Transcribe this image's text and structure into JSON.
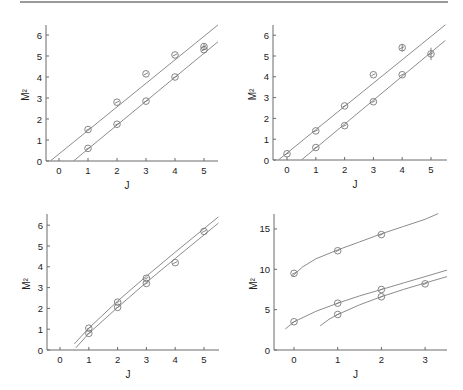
{
  "figure": {
    "top_rule": true
  },
  "chart_data": [
    {
      "id": "panel-top-left",
      "type": "scatter",
      "title": "",
      "xlabel": "J",
      "ylabel": "M²",
      "xlim": [
        -0.5,
        5.5
      ],
      "ylim": [
        0,
        6.5
      ],
      "xticks": [
        0,
        1,
        2,
        3,
        4,
        5
      ],
      "yticks": [
        0,
        1,
        2,
        3,
        4,
        5,
        6
      ],
      "grid": false,
      "box": {
        "x0": 46,
        "y0": 161,
        "x_of_j0": 59,
        "px_per_x": 29,
        "px_per_y": 21,
        "x_end": 218,
        "y_top": 25
      },
      "series": [
        {
          "name": "upper",
          "x": [
            1,
            2,
            3,
            4,
            5
          ],
          "y": [
            1.5,
            2.8,
            4.15,
            5.05,
            5.45
          ],
          "err": [
            0,
            0,
            0,
            0,
            0.15
          ]
        },
        {
          "name": "lower",
          "x": [
            1,
            2,
            3,
            4,
            5
          ],
          "y": [
            0.6,
            1.75,
            2.85,
            4.0,
            5.3
          ],
          "err": [
            0,
            0,
            0,
            0,
            0
          ]
        }
      ],
      "fits": [
        {
          "name": "upper-fit",
          "points": [
            [
              -0.3,
              0
            ],
            [
              5.5,
              6.5
            ]
          ]
        },
        {
          "name": "lower-fit",
          "points": [
            [
              0.5,
              0
            ],
            [
              5.5,
              5.7
            ]
          ]
        }
      ]
    },
    {
      "id": "panel-top-right",
      "type": "scatter",
      "title": "",
      "xlabel": "J",
      "ylabel": "M²",
      "xlim": [
        -0.5,
        5.5
      ],
      "ylim": [
        0,
        6.5
      ],
      "xticks": [
        0,
        1,
        2,
        3,
        4,
        5
      ],
      "yticks": [
        0,
        1,
        2,
        3,
        4,
        5,
        6
      ],
      "grid": false,
      "box": {
        "x0": 273,
        "y0": 160,
        "x_of_j0": 287,
        "px_per_x": 28.8,
        "px_per_y": 20.8,
        "x_end": 447,
        "y_top": 25
      },
      "series": [
        {
          "name": "upper",
          "x": [
            0,
            1,
            2,
            3,
            4
          ],
          "y": [
            0.3,
            1.4,
            2.6,
            4.1,
            5.4
          ],
          "err": [
            0,
            0,
            0,
            0,
            0.18
          ]
        },
        {
          "name": "lower",
          "x": [
            1,
            2,
            3,
            4,
            5
          ],
          "y": [
            0.6,
            1.65,
            2.8,
            4.1,
            5.1
          ],
          "err": [
            0,
            0,
            0,
            0,
            0.3
          ]
        }
      ],
      "fits": [
        {
          "name": "upper-fit",
          "points": [
            [
              -0.3,
              0
            ],
            [
              5.5,
              6.5
            ]
          ]
        },
        {
          "name": "lower-fit",
          "points": [
            [
              0.5,
              0
            ],
            [
              5.5,
              5.75
            ]
          ]
        }
      ]
    },
    {
      "id": "panel-bottom-left",
      "type": "scatter",
      "title": "",
      "xlabel": "J",
      "ylabel": "M²",
      "xlim": [
        -0.5,
        5.5
      ],
      "ylim": [
        0,
        6.5
      ],
      "xticks": [
        0,
        1,
        2,
        3,
        4,
        5
      ],
      "yticks": [
        0,
        1,
        2,
        3,
        4,
        5,
        6
      ],
      "grid": false,
      "box": {
        "x0": 47,
        "y0": 350,
        "x_of_j0": 60,
        "px_per_x": 28.8,
        "px_per_y": 20.8,
        "x_end": 219,
        "y_top": 214
      },
      "series": [
        {
          "name": "upper",
          "x": [
            1,
            2,
            3,
            5
          ],
          "y": [
            1.05,
            2.3,
            3.45,
            5.7
          ],
          "err": [
            0,
            0,
            0,
            0
          ]
        },
        {
          "name": "lower",
          "x": [
            1,
            2,
            3,
            4
          ],
          "y": [
            0.8,
            2.05,
            3.2,
            4.2
          ],
          "err": [
            0,
            0,
            0,
            0
          ]
        }
      ],
      "fits": [
        {
          "name": "upper-fit",
          "points": [
            [
              0.5,
              0.3
            ],
            [
              1,
              1.05
            ],
            [
              2,
              2.35
            ],
            [
              3,
              3.55
            ],
            [
              4,
              4.7
            ],
            [
              5.5,
              6.4
            ]
          ]
        },
        {
          "name": "lower-fit",
          "points": [
            [
              0.55,
              0.1
            ],
            [
              1,
              0.8
            ],
            [
              2,
              2.05
            ],
            [
              3,
              3.25
            ],
            [
              4,
              4.4
            ],
            [
              5.5,
              6.1
            ]
          ]
        }
      ]
    },
    {
      "id": "panel-bottom-right",
      "type": "scatter",
      "title": "",
      "xlabel": "J",
      "ylabel": "M²",
      "xlim": [
        -0.5,
        3.5
      ],
      "ylim": [
        0,
        17
      ],
      "xticks": [
        0,
        1,
        2,
        3
      ],
      "yticks": [
        0,
        5,
        10,
        15
      ],
      "grid": false,
      "box": {
        "x0": 274,
        "y0": 350,
        "x_of_j0": 294,
        "px_per_x": 43.7,
        "px_per_y": 8.07,
        "x_end": 447,
        "y_top": 214
      },
      "series": [
        {
          "name": "top",
          "x": [
            0,
            1,
            2
          ],
          "y": [
            9.5,
            12.3,
            14.3
          ],
          "err": [
            0,
            0,
            0
          ]
        },
        {
          "name": "middle",
          "x": [
            0,
            1,
            2
          ],
          "y": [
            3.5,
            5.8,
            7.5
          ],
          "err": [
            0,
            0,
            0
          ]
        },
        {
          "name": "lower",
          "x": [
            1,
            2,
            3
          ],
          "y": [
            4.4,
            6.6,
            8.2
          ],
          "err": [
            0,
            0,
            0
          ]
        }
      ],
      "fits": [
        {
          "name": "top-fit",
          "points": [
            [
              -0.05,
              9.1
            ],
            [
              0.2,
              10.3
            ],
            [
              0.5,
              11.3
            ],
            [
              1,
              12.4
            ],
            [
              1.5,
              13.4
            ],
            [
              2,
              14.4
            ],
            [
              2.5,
              15.3
            ],
            [
              3,
              16.2
            ],
            [
              3.3,
              16.9
            ]
          ]
        },
        {
          "name": "middle-fit",
          "points": [
            [
              -0.2,
              2.6
            ],
            [
              0,
              3.5
            ],
            [
              0.5,
              4.8
            ],
            [
              1,
              5.8
            ],
            [
              1.5,
              6.7
            ],
            [
              2,
              7.5
            ],
            [
              2.5,
              8.3
            ],
            [
              3,
              9.1
            ],
            [
              3.5,
              9.9
            ]
          ]
        },
        {
          "name": "lower-fit",
          "points": [
            [
              0.6,
              3.0
            ],
            [
              0.8,
              3.8
            ],
            [
              1,
              4.4
            ],
            [
              1.5,
              5.6
            ],
            [
              2,
              6.6
            ],
            [
              2.5,
              7.5
            ],
            [
              3,
              8.3
            ],
            [
              3.5,
              9.1
            ]
          ]
        }
      ]
    }
  ]
}
